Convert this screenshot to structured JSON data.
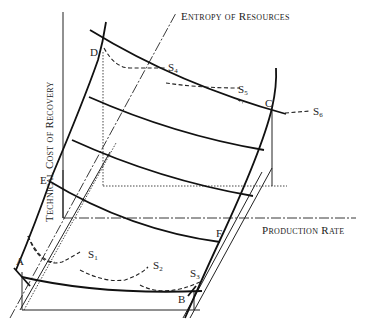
{
  "diagram": {
    "axes": {
      "y_label": "Technical Cost of Recovery",
      "x_label": "Production Rate",
      "z_label": "Entropy of Resources"
    },
    "points": {
      "A": "A",
      "B": "B",
      "C": "C",
      "D": "D",
      "E": "E",
      "F": "F"
    },
    "paths": [
      {
        "id": "S1",
        "base": "S",
        "sub": "1"
      },
      {
        "id": "S2",
        "base": "S",
        "sub": "2"
      },
      {
        "id": "S3",
        "base": "S",
        "sub": "3"
      },
      {
        "id": "S4",
        "base": "S",
        "sub": "4"
      },
      {
        "id": "S5",
        "base": "S",
        "sub": "5"
      },
      {
        "id": "S6",
        "base": "S",
        "sub": "6"
      }
    ],
    "colors": {
      "line": "#111111",
      "background": "#ffffff"
    }
  }
}
